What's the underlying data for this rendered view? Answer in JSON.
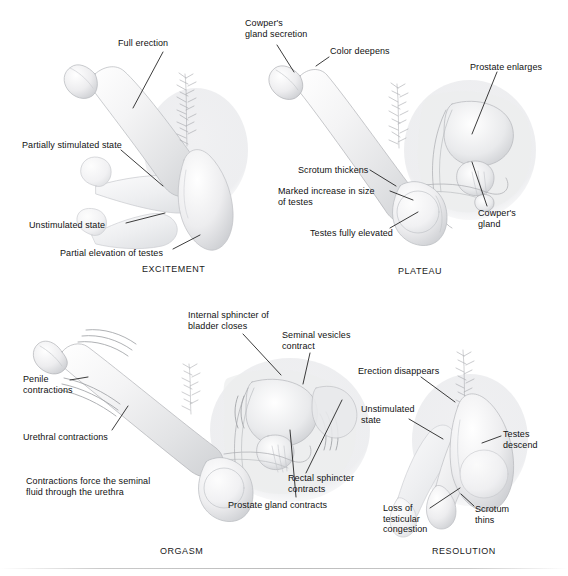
{
  "figure": {
    "background_color": "#ffffff",
    "text_color": "#111111",
    "label_font_size_px": 9,
    "footer_rule": true
  },
  "panels": [
    {
      "id": "excitement",
      "caption": "EXCITEMENT",
      "caption_pos": {
        "x": 142,
        "y": 264
      },
      "labels": [
        {
          "name": "full-erection",
          "text": "Full erection",
          "x": 118,
          "y": 38,
          "leader": [
            [
              163,
              52
            ],
            [
              133,
              108
            ]
          ]
        },
        {
          "name": "partially-stimulated",
          "text": "Partially stimulated state",
          "x": 22,
          "y": 140,
          "leader": [
            [
              121,
              150
            ],
            [
              163,
              186
            ]
          ]
        },
        {
          "name": "unstimulated-state",
          "text": "Unstimulated state",
          "x": 29,
          "y": 220,
          "leader": [
            [
              126,
              223
            ],
            [
              165,
              213
            ]
          ]
        },
        {
          "name": "partial-elevation",
          "text": "Partial elevation of testes",
          "x": 60,
          "y": 248,
          "leader": [
            [
              173,
              249
            ],
            [
              200,
              235
            ]
          ]
        }
      ]
    },
    {
      "id": "plateau",
      "caption": "PLATEAU",
      "caption_pos": {
        "x": 398,
        "y": 266
      },
      "labels": [
        {
          "name": "cowpers-gland-secretion",
          "text": "Cowper's\ngland secretion",
          "x": 245,
          "y": 18,
          "leader": [
            [
              277,
              45
            ],
            [
              294,
              72
            ]
          ]
        },
        {
          "name": "color-deepens",
          "text": "Color deepens",
          "x": 330,
          "y": 46,
          "leader": [
            [
              329,
              57
            ],
            [
              316,
              66
            ]
          ]
        },
        {
          "name": "prostate-enlarges",
          "text": "Prostate enlarges",
          "x": 470,
          "y": 62,
          "leader": [
            [
              497,
              72
            ],
            [
              472,
              134
            ]
          ]
        },
        {
          "name": "scrotum-thickens",
          "text": "Scrotum thickens",
          "x": 298,
          "y": 165,
          "leader": [
            [
              370,
              170
            ],
            [
              396,
              186
            ]
          ]
        },
        {
          "name": "marked-increase-testes",
          "text": "Marked increase in size\nof testes",
          "x": 278,
          "y": 186,
          "leader": [
            [
              390,
              191
            ],
            [
              413,
              200
            ]
          ]
        },
        {
          "name": "testes-fully-elevated",
          "text": "Testes fully elevated",
          "x": 310,
          "y": 228,
          "leader": [
            [
              390,
              228
            ],
            [
              418,
              212
            ]
          ]
        },
        {
          "name": "cowpers-gland",
          "text": "Cowper's\ngland",
          "x": 478,
          "y": 208,
          "leader": [
            [
              487,
              206
            ],
            [
              472,
              162
            ]
          ]
        }
      ]
    },
    {
      "id": "orgasm",
      "caption": "ORGASM",
      "caption_pos": {
        "x": 160,
        "y": 546
      },
      "labels": [
        {
          "name": "internal-sphincter",
          "text": "Internal sphincter of\nbladder closes",
          "x": 188,
          "y": 310,
          "leader": [
            [
              243,
              334
            ],
            [
              281,
              375
            ]
          ]
        },
        {
          "name": "seminal-vesicles",
          "text": "Seminal vesicles\ncontract",
          "x": 282,
          "y": 330,
          "leader": [
            [
              310,
              353
            ],
            [
              303,
              384
            ]
          ]
        },
        {
          "name": "penile-contractions",
          "text": "Penile\ncontractions",
          "x": 23,
          "y": 374,
          "leader": [
            [
              70,
              380
            ],
            [
              88,
              377
            ]
          ]
        },
        {
          "name": "urethral-contractions",
          "text": "Urethral contractions",
          "x": 23,
          "y": 432,
          "leader": [
            [
              112,
              430
            ],
            [
              128,
              406
            ]
          ]
        },
        {
          "name": "contractions-force",
          "text": "Contractions force the seminal\nfluid through the urethra",
          "x": 26,
          "y": 476,
          "leader": null
        },
        {
          "name": "rectal-sphincter",
          "text": "Rectal sphincter\ncontracts",
          "x": 288,
          "y": 473,
          "leader": [
            [
              306,
              473
            ],
            [
              342,
              400
            ]
          ]
        },
        {
          "name": "prostate-gland-contracts",
          "text": "Prostate gland contracts",
          "x": 228,
          "y": 500,
          "leader": [
            [
              296,
              497
            ],
            [
              290,
              430
            ]
          ]
        }
      ]
    },
    {
      "id": "resolution",
      "caption": "RESOLUTION",
      "caption_pos": {
        "x": 432,
        "y": 546
      },
      "labels": [
        {
          "name": "erection-disappears",
          "text": "Erection disappears",
          "x": 358,
          "y": 366,
          "leader": [
            [
              421,
              377
            ],
            [
              455,
              402
            ]
          ]
        },
        {
          "name": "unstimulated-state",
          "text": "Unstimulated\nstate",
          "x": 361,
          "y": 404,
          "leader": [
            [
              409,
              419
            ],
            [
              443,
              439
            ]
          ]
        },
        {
          "name": "testes-descend",
          "text": "Testes\ndescend",
          "x": 503,
          "y": 429,
          "leader": [
            [
              501,
              436
            ],
            [
              482,
              443
            ]
          ]
        },
        {
          "name": "loss-of-congestion",
          "text": "Loss of\ntesticular\ncongestion",
          "x": 383,
          "y": 503,
          "leader": [
            [
              430,
              508
            ],
            [
              460,
              488
            ]
          ]
        },
        {
          "name": "scrotum-thins",
          "text": "Scrotum\nthins",
          "x": 475,
          "y": 504,
          "leader": [
            [
              474,
              506
            ],
            [
              461,
              494
            ]
          ]
        }
      ]
    }
  ]
}
